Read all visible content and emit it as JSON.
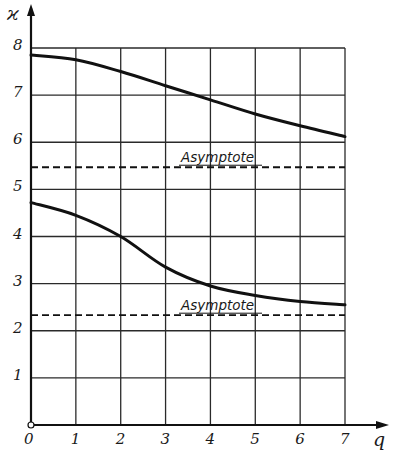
{
  "chart_data": {
    "type": "line",
    "title": "",
    "xlabel": "q",
    "ylabel": "ϰ",
    "xlim": [
      0,
      7
    ],
    "ylim": [
      0,
      8
    ],
    "grid": true,
    "x_ticks": [
      "0",
      "1",
      "2",
      "3",
      "4",
      "5",
      "6",
      "7"
    ],
    "y_ticks": [
      "1",
      "2",
      "3",
      "4",
      "5",
      "6",
      "7",
      "8"
    ],
    "x": [
      0,
      1,
      2,
      3,
      4,
      5,
      6,
      7
    ],
    "series": [
      {
        "name": "upper branch",
        "style": "solid",
        "values": [
          7.85,
          7.75,
          7.5,
          7.2,
          6.9,
          6.6,
          6.35,
          6.12
        ]
      },
      {
        "name": "lower branch",
        "style": "solid",
        "values": [
          4.72,
          4.45,
          4.0,
          3.35,
          2.95,
          2.75,
          2.62,
          2.55
        ]
      }
    ],
    "asymptotes": [
      {
        "label": "Asymptote",
        "y": 5.47,
        "style": "dashed"
      },
      {
        "label": "Asymptote",
        "y": 2.33,
        "style": "dashed"
      }
    ],
    "annotations": [
      "Asymptote",
      "Asymptote"
    ],
    "legend": null
  }
}
